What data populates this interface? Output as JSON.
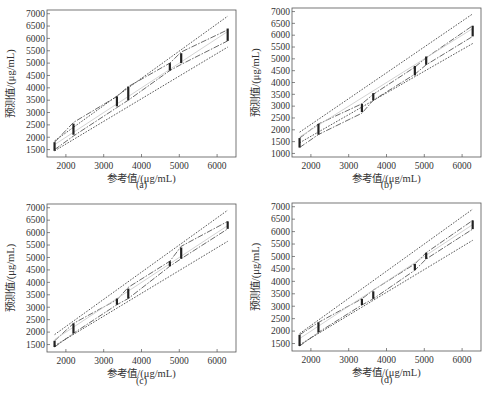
{
  "figure": {
    "panels": [
      "(a)",
      "(b)",
      "(c)",
      "(d)"
    ],
    "xlabel": "参考值/(μg/mL)",
    "ylabel": "预测值/(μg/mL)"
  },
  "chart_data": [
    {
      "type": "line",
      "panel": "(a)",
      "xlabel": "参考值/(μg/mL)",
      "ylabel": "预测值/(μg/mL)",
      "xlim": [
        1500,
        6500
      ],
      "ylim": [
        1200,
        7150
      ],
      "xticks": [
        2000,
        3000,
        4000,
        5000,
        6000
      ],
      "yticks": [
        1500,
        2000,
        2500,
        3000,
        3500,
        4000,
        4500,
        5000,
        5500,
        6000,
        6500,
        7000
      ],
      "x": [
        1700,
        2200,
        3350,
        3650,
        4750,
        5050,
        6280
      ],
      "series": [
        {
          "name": "upper band",
          "values": [
            1800,
            2600,
            3650,
            4050,
            5000,
            5450,
            6350
          ]
        },
        {
          "name": "lower band",
          "values": [
            1500,
            2050,
            3200,
            3500,
            4700,
            4950,
            5900
          ]
        },
        {
          "name": "ideal",
          "values": [
            1700,
            2200,
            3350,
            3650,
            4750,
            5050,
            6280
          ]
        },
        {
          "name": "upper limit",
          "values": [
            1850,
            null,
            null,
            null,
            null,
            null,
            6900
          ]
        },
        {
          "name": "lower limit",
          "values": [
            1450,
            null,
            null,
            null,
            null,
            null,
            5650
          ]
        }
      ],
      "error_bars": [
        [
          1700,
          1450,
          1800
        ],
        [
          2200,
          2100,
          2550
        ],
        [
          3350,
          3250,
          3650
        ],
        [
          3650,
          3500,
          4050
        ],
        [
          4750,
          4700,
          5000
        ],
        [
          5050,
          5000,
          5400
        ],
        [
          6280,
          5900,
          6400
        ]
      ]
    },
    {
      "type": "line",
      "panel": "(b)",
      "xlabel": "参考值/(μg/mL)",
      "ylabel": "预测值/(μg/mL)",
      "xlim": [
        1500,
        6500
      ],
      "ylim": [
        850,
        7150
      ],
      "xticks": [
        2000,
        3000,
        4000,
        5000,
        6000
      ],
      "yticks": [
        1000,
        1500,
        2000,
        2500,
        3000,
        3500,
        4000,
        4500,
        5000,
        5500,
        6000,
        6500,
        7000
      ],
      "x": [
        1700,
        2200,
        3350,
        3650,
        4750,
        5050,
        6280
      ],
      "series": [
        {
          "name": "upper band",
          "values": [
            1650,
            2250,
            3100,
            3500,
            4650,
            5050,
            6400
          ]
        },
        {
          "name": "lower band",
          "values": [
            1250,
            1800,
            2700,
            3250,
            4350,
            4750,
            5950
          ]
        },
        {
          "name": "ideal",
          "values": [
            1700,
            2200,
            3350,
            3650,
            4750,
            5050,
            6280
          ]
        },
        {
          "name": "upper limit",
          "values": [
            1900,
            null,
            null,
            null,
            null,
            null,
            6900
          ]
        },
        {
          "name": "lower limit",
          "values": [
            1450,
            null,
            null,
            null,
            null,
            null,
            5650
          ]
        }
      ],
      "error_bars": [
        [
          1700,
          1250,
          1650
        ],
        [
          2200,
          1800,
          2250
        ],
        [
          3350,
          2750,
          3100
        ],
        [
          3650,
          3250,
          3550
        ],
        [
          4750,
          4300,
          4700
        ],
        [
          5050,
          4750,
          5100
        ],
        [
          6280,
          5950,
          6400
        ]
      ]
    },
    {
      "type": "line",
      "panel": "(c)",
      "xlabel": "参考值/(μg/mL)",
      "ylabel": "预测值/(μg/mL)",
      "xlim": [
        1500,
        6500
      ],
      "ylim": [
        1200,
        7150
      ],
      "xticks": [
        2000,
        3000,
        4000,
        5000,
        6000
      ],
      "yticks": [
        1500,
        2000,
        2500,
        3000,
        3500,
        4000,
        4500,
        5000,
        5500,
        6000,
        6500,
        7000
      ],
      "x": [
        1700,
        2200,
        3350,
        3650,
        4750,
        5050,
        6280
      ],
      "series": [
        {
          "name": "upper band",
          "values": [
            1650,
            2350,
            3300,
            3800,
            4850,
            5450,
            6450
          ]
        },
        {
          "name": "lower band",
          "values": [
            1400,
            1950,
            3100,
            3350,
            4650,
            4950,
            6150
          ]
        },
        {
          "name": "ideal",
          "values": [
            1700,
            2200,
            3350,
            3650,
            4750,
            5050,
            6280
          ]
        },
        {
          "name": "upper limit",
          "values": [
            1900,
            null,
            null,
            null,
            null,
            null,
            6900
          ]
        },
        {
          "name": "lower limit",
          "values": [
            1450,
            null,
            null,
            null,
            null,
            null,
            5650
          ]
        }
      ],
      "error_bars": [
        [
          1700,
          1400,
          1650
        ],
        [
          2200,
          1950,
          2350
        ],
        [
          3350,
          3100,
          3350
        ],
        [
          3650,
          3350,
          3750
        ],
        [
          4750,
          4650,
          4850
        ],
        [
          5050,
          4950,
          5400
        ],
        [
          6280,
          6150,
          6450
        ]
      ]
    },
    {
      "type": "line",
      "panel": "(d)",
      "xlabel": "参考值/(μg/mL)",
      "ylabel": "预测值/(μg/mL)",
      "xlim": [
        1500,
        6500
      ],
      "ylim": [
        1200,
        7150
      ],
      "xticks": [
        2000,
        3000,
        4000,
        5000,
        6000
      ],
      "yticks": [
        1500,
        2000,
        2500,
        3000,
        3500,
        4000,
        4500,
        5000,
        5500,
        6000,
        6500,
        7000
      ],
      "x": [
        1700,
        2200,
        3350,
        3650,
        4750,
        5050,
        6280
      ],
      "series": [
        {
          "name": "upper band",
          "values": [
            1850,
            2350,
            3300,
            3650,
            4700,
            5150,
            6450
          ]
        },
        {
          "name": "lower band",
          "values": [
            1400,
            1950,
            3050,
            3300,
            4450,
            4900,
            6100
          ]
        },
        {
          "name": "ideal",
          "values": [
            1700,
            2200,
            3350,
            3650,
            4750,
            5050,
            6280
          ]
        },
        {
          "name": "upper limit",
          "values": [
            1900,
            null,
            null,
            null,
            null,
            null,
            6900
          ]
        },
        {
          "name": "lower limit",
          "values": [
            1450,
            null,
            null,
            null,
            null,
            null,
            5650
          ]
        }
      ],
      "error_bars": [
        [
          1700,
          1400,
          1850
        ],
        [
          2200,
          1950,
          2350
        ],
        [
          3350,
          3050,
          3300
        ],
        [
          3650,
          3300,
          3600
        ],
        [
          4750,
          4450,
          4700
        ],
        [
          5050,
          4900,
          5150
        ],
        [
          6280,
          6100,
          6450
        ]
      ]
    }
  ]
}
